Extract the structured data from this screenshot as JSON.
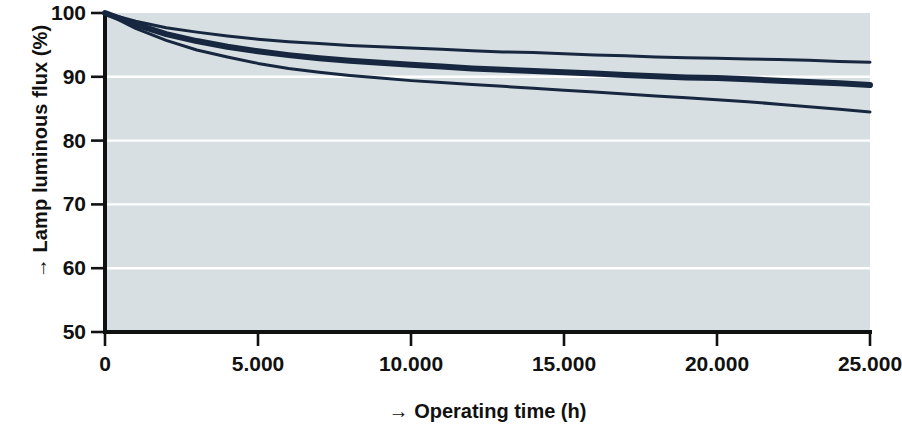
{
  "chart_data": {
    "type": "line",
    "title": "",
    "xlabel": "→ Operating time (h)",
    "ylabel": "→ Lamp luminous flux (%)",
    "xlim": [
      0,
      25000
    ],
    "ylim": [
      50,
      100
    ],
    "grid": true,
    "gridlines_y": [
      60,
      70,
      80,
      90
    ],
    "legend": "none",
    "background_color": "#d6dee1",
    "line_color": "#16273f",
    "x_tick_labels": [
      "0",
      "5.000",
      "10.000",
      "15.000",
      "20.000",
      "25.000"
    ],
    "x_tick_values": [
      0,
      5000,
      10000,
      15000,
      20000,
      25000
    ],
    "y_tick_labels": [
      "50",
      "60",
      "70",
      "80",
      "90",
      "100"
    ],
    "y_tick_values": [
      50,
      60,
      70,
      80,
      90,
      100
    ],
    "x": [
      0,
      1000,
      2000,
      3000,
      4000,
      5000,
      6000,
      7000,
      8000,
      9000,
      10000,
      11000,
      12000,
      13000,
      14000,
      15000,
      16000,
      17000,
      18000,
      19000,
      20000,
      21000,
      22000,
      23000,
      24000,
      25000
    ],
    "series": [
      {
        "name": "Curve A (upper)",
        "line_width": 3,
        "values": [
          100,
          98.7,
          97.7,
          97.0,
          96.4,
          95.9,
          95.5,
          95.2,
          94.9,
          94.7,
          94.5,
          94.3,
          94.1,
          93.9,
          93.8,
          93.6,
          93.4,
          93.3,
          93.1,
          93.0,
          92.9,
          92.8,
          92.7,
          92.6,
          92.4,
          92.3
        ]
      },
      {
        "name": "Curve B (middle, bold)",
        "line_width": 6,
        "values": [
          100,
          98.2,
          96.7,
          95.6,
          94.7,
          94.0,
          93.4,
          92.9,
          92.5,
          92.2,
          91.9,
          91.6,
          91.3,
          91.1,
          90.9,
          90.7,
          90.5,
          90.3,
          90.1,
          89.9,
          89.8,
          89.6,
          89.4,
          89.2,
          89.0,
          88.7
        ]
      },
      {
        "name": "Curve C (lower)",
        "line_width": 3,
        "values": [
          100,
          97.6,
          95.7,
          94.2,
          93.1,
          92.1,
          91.3,
          90.7,
          90.2,
          89.8,
          89.4,
          89.1,
          88.8,
          88.5,
          88.2,
          87.9,
          87.6,
          87.3,
          87.0,
          86.7,
          86.4,
          86.1,
          85.7,
          85.3,
          84.9,
          84.5
        ]
      }
    ]
  },
  "axis": {
    "y_arrow": "→",
    "x_arrow": "→"
  }
}
